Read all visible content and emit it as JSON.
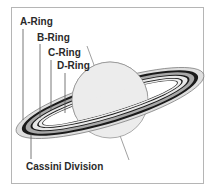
{
  "diagram": {
    "labels": {
      "a_ring": "A-Ring",
      "b_ring": "B-Ring",
      "c_ring": "C-Ring",
      "d_ring": "D-Ring",
      "cassini_division": "Cassini Division"
    },
    "colors": {
      "planet_fill": "#ececec",
      "ring_light": "#dcdcdc",
      "ring_mid": "#a8a8a8",
      "ring_dark": "#1a1a1a",
      "outline": "#555555",
      "frame_border": "#b5b5b5"
    }
  }
}
